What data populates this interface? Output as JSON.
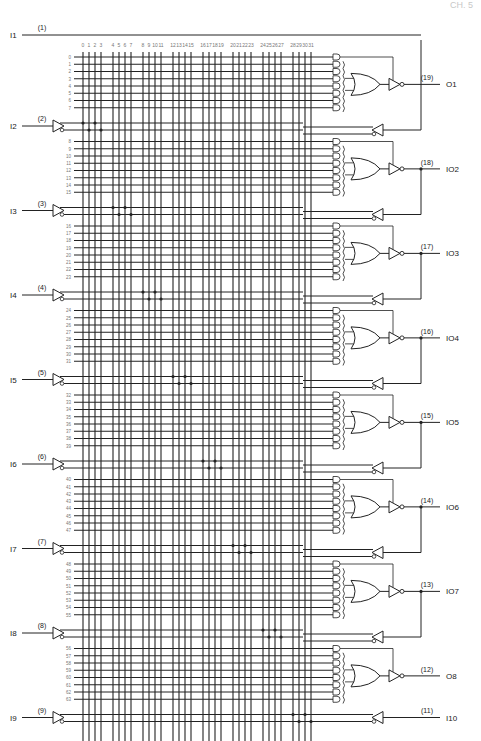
{
  "header": {
    "left": "",
    "right": "CH. 5"
  },
  "diagram": {
    "type": "PAL logic diagram (PAL16L8-style)",
    "columns": [
      "0",
      "1",
      "2",
      "3",
      "4",
      "5",
      "6",
      "7",
      "8",
      "9",
      "10",
      "11",
      "12",
      "13",
      "14",
      "15",
      "16",
      "17",
      "18",
      "19",
      "20",
      "21",
      "22",
      "23",
      "24",
      "25",
      "26",
      "27",
      "28",
      "29",
      "30",
      "31"
    ],
    "dedicated_inputs": [
      {
        "name": "I1",
        "pin": "(1)"
      },
      {
        "name": "I2",
        "pin": "(2)"
      },
      {
        "name": "I3",
        "pin": "(3)"
      },
      {
        "name": "I4",
        "pin": "(4)"
      },
      {
        "name": "I5",
        "pin": "(5)"
      },
      {
        "name": "I6",
        "pin": "(6)"
      },
      {
        "name": "I7",
        "pin": "(7)"
      },
      {
        "name": "I8",
        "pin": "(8)"
      },
      {
        "name": "I9",
        "pin": "(9)"
      },
      {
        "name": "I10",
        "pin": "(11)"
      }
    ],
    "outputs": [
      {
        "name": "O1",
        "pin": "(19)",
        "rows": [
          "0",
          "1",
          "2",
          "3",
          "4",
          "5",
          "6",
          "7"
        ],
        "feedback": false
      },
      {
        "name": "IO2",
        "pin": "(18)",
        "rows": [
          "8",
          "9",
          "10",
          "11",
          "12",
          "13",
          "14",
          "15"
        ],
        "feedback": true
      },
      {
        "name": "IO3",
        "pin": "(17)",
        "rows": [
          "16",
          "17",
          "18",
          "19",
          "20",
          "21",
          "22",
          "23"
        ],
        "feedback": true
      },
      {
        "name": "IO4",
        "pin": "(16)",
        "rows": [
          "24",
          "25",
          "26",
          "27",
          "28",
          "29",
          "30",
          "31"
        ],
        "feedback": true
      },
      {
        "name": "IO5",
        "pin": "(15)",
        "rows": [
          "32",
          "33",
          "34",
          "35",
          "36",
          "37",
          "38",
          "39"
        ],
        "feedback": true
      },
      {
        "name": "IO6",
        "pin": "(14)",
        "rows": [
          "40",
          "41",
          "42",
          "43",
          "44",
          "45",
          "46",
          "47"
        ],
        "feedback": true
      },
      {
        "name": "IO7",
        "pin": "(13)",
        "rows": [
          "48",
          "49",
          "50",
          "51",
          "52",
          "53",
          "54",
          "55"
        ],
        "feedback": true
      },
      {
        "name": "O8",
        "pin": "(12)",
        "rows": [
          "56",
          "57",
          "58",
          "59",
          "60",
          "61",
          "62",
          "63"
        ],
        "feedback": false
      }
    ],
    "colors": {
      "line": "#222222",
      "row_label": "#888888",
      "header": "#c8c8c8"
    }
  }
}
